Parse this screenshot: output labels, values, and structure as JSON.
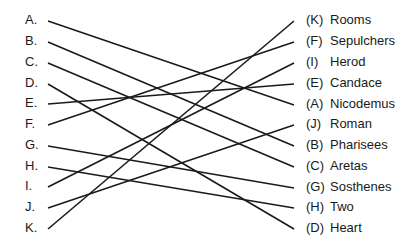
{
  "diagram": {
    "type": "matching-lines",
    "line_color": "#1a1a1a",
    "left_items": [
      {
        "label": "A.",
        "y": 20
      },
      {
        "label": "B.",
        "y": 41
      },
      {
        "label": "C.",
        "y": 62
      },
      {
        "label": "D.",
        "y": 83
      },
      {
        "label": "E.",
        "y": 103
      },
      {
        "label": "F.",
        "y": 124
      },
      {
        "label": "G.",
        "y": 145
      },
      {
        "label": "H.",
        "y": 166
      },
      {
        "label": "I.",
        "y": 186
      },
      {
        "label": "J.",
        "y": 207
      },
      {
        "label": "K.",
        "y": 228
      }
    ],
    "right_items": [
      {
        "letter": "(K)",
        "word": "Rooms",
        "y": 20
      },
      {
        "letter": "(F)",
        "word": "Sepulchers",
        "y": 41
      },
      {
        "letter": "(I)",
        "word": "Herod",
        "y": 62
      },
      {
        "letter": "(E)",
        "word": "Candace",
        "y": 83
      },
      {
        "letter": "(A)",
        "word": "Nicodemus",
        "y": 104
      },
      {
        "letter": "(J)",
        "word": "Roman",
        "y": 124
      },
      {
        "letter": "(B)",
        "word": "Pharisees",
        "y": 145
      },
      {
        "letter": "(C)",
        "word": "Aretas",
        "y": 166
      },
      {
        "letter": "(G)",
        "word": "Sosthenes",
        "y": 187
      },
      {
        "letter": "(H)",
        "word": "Two",
        "y": 207
      },
      {
        "letter": "(D)",
        "word": "Heart",
        "y": 228
      }
    ],
    "connections": [
      {
        "from": "A",
        "to_index": 4
      },
      {
        "from": "B",
        "to_index": 6
      },
      {
        "from": "C",
        "to_index": 7
      },
      {
        "from": "D",
        "to_index": 10
      },
      {
        "from": "E",
        "to_index": 3
      },
      {
        "from": "F",
        "to_index": 1
      },
      {
        "from": "G",
        "to_index": 8
      },
      {
        "from": "H",
        "to_index": 9
      },
      {
        "from": "I",
        "to_index": 2
      },
      {
        "from": "J",
        "to_index": 5
      },
      {
        "from": "K",
        "to_index": 0
      }
    ]
  }
}
